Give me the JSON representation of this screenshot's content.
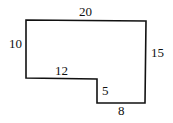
{
  "figure": {
    "type": "L-shaped polygon with side lengths",
    "line_color": "#111111",
    "labels": {
      "top": "20",
      "left": "10",
      "right": "15",
      "inner_horizontal": "12",
      "inner_vertical": "5",
      "bottom": "8"
    }
  }
}
